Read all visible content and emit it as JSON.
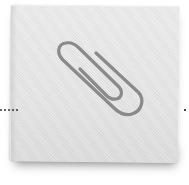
{
  "note": {
    "icon": "paperclip-icon",
    "paper_color": "#e8e8e8",
    "clip_color": "#8a8a8a"
  },
  "connector": {
    "left_dot_count": 5,
    "dot_color": "#333333"
  }
}
